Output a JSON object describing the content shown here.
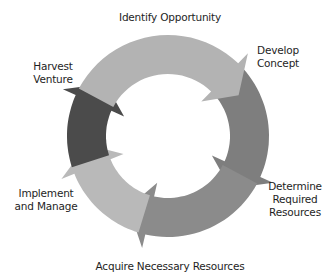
{
  "diagram": {
    "type": "cycle",
    "center": [
      168,
      136
    ],
    "outer_radius": 101,
    "inner_radius": 62,
    "stages": [
      {
        "label": "Identify Opportunity",
        "from_angle": -62,
        "to_angle": 48,
        "color": "#b3b3b3"
      },
      {
        "label": "Develop Concept",
        "from_angle": 48,
        "to_angle": 118,
        "color": "#7e7e7e"
      },
      {
        "label": "Determine Required Resources",
        "from_angle": 118,
        "to_angle": 197,
        "color": "#8b8b8b"
      },
      {
        "label": "Acquire Necessary Resources",
        "from_angle": 197,
        "to_angle": 252,
        "color": "#b9b9b9"
      },
      {
        "label": "Implement and Manage",
        "from_angle": 252,
        "to_angle": 298,
        "color": "#4b4b4b"
      }
    ]
  },
  "labels": {
    "identify": "Identify Opportunity",
    "develop": "Develop\nConcept",
    "determine": "Determine\nRequired\nResources",
    "acquire": "Acquire Necessary Resources",
    "implement": "Implement\nand Manage",
    "harvest": "Harvest\nVenture"
  }
}
